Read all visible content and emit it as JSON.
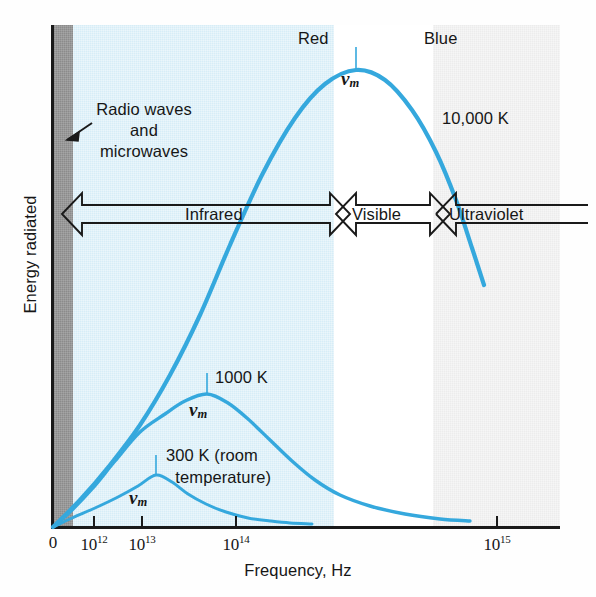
{
  "figure": {
    "axes": {
      "x_title": "Frequency, Hz",
      "y_title": "Energy radiated",
      "x_ticks": [
        {
          "label": "0",
          "sup": "",
          "x": 53
        },
        {
          "label": "10",
          "sup": "12",
          "x": 94
        },
        {
          "label": "10",
          "sup": "13",
          "x": 142
        },
        {
          "label": "10",
          "sup": "14",
          "x": 236
        },
        {
          "label": "10",
          "sup": "15",
          "x": 497
        }
      ]
    },
    "bands": [
      {
        "name": "radio-microwave-band",
        "color": "#8b8b8b"
      },
      {
        "name": "infrared-band",
        "color": "#d6edf7"
      },
      {
        "name": "visible-band",
        "color": "#ffffff"
      },
      {
        "name": "ultraviolet-band",
        "color": "#ececec"
      }
    ],
    "spectrum_arrow_labels": {
      "infrared": "Infrared",
      "visible": "Visible",
      "ultraviolet": "Ultraviolet"
    },
    "annotations": {
      "radio_waves": "Radio waves\nand\nmicrowaves",
      "red": "Red",
      "blue": "Blue",
      "curve_10000k": "10,000 K",
      "curve_1000k": "1000 K",
      "curve_300k": "300 K (room\n  temperature)",
      "nu_m_10000k": "ν",
      "nu_m_1000k": "ν",
      "nu_m_300k": "ν",
      "nu_subscript": "m"
    },
    "curve_color": "#35a8dd"
  },
  "chart_data": {
    "type": "line",
    "xlabel": "Frequency, Hz",
    "ylabel": "Energy radiated",
    "xscale": "log-like (compressed above 1e14)",
    "xticklabels": [
      "0",
      "10^12",
      "10^13",
      "10^14",
      "10^15"
    ],
    "yticklabels": [],
    "grid": false,
    "legend": "inline annotations",
    "series": [
      {
        "name": "10,000 K",
        "label": "10,000 K",
        "peak_label": "ν_m",
        "peak_frequency_hz": "~1.0e15",
        "color": "#35a8dd",
        "points_px": [
          [
            53,
            527
          ],
          [
            80,
            500
          ],
          [
            110,
            465
          ],
          [
            140,
            425
          ],
          [
            170,
            375
          ],
          [
            200,
            315
          ],
          [
            230,
            245
          ],
          [
            262,
            175
          ],
          [
            295,
            118
          ],
          [
            325,
            84
          ],
          [
            356,
            70
          ],
          [
            385,
            80
          ],
          [
            412,
            110
          ],
          [
            436,
            152
          ],
          [
            456,
            200
          ],
          [
            472,
            248
          ],
          [
            484,
            285
          ]
        ]
      },
      {
        "name": "1000 K",
        "label": "1000 K",
        "peak_label": "ν_m",
        "peak_frequency_hz": "~1.0e14",
        "color": "#35a8dd",
        "points_px": [
          [
            53,
            527
          ],
          [
            70,
            512
          ],
          [
            92,
            489
          ],
          [
            115,
            461
          ],
          [
            140,
            432
          ],
          [
            165,
            414
          ],
          [
            185,
            401
          ],
          [
            207,
            394
          ],
          [
            228,
            403
          ],
          [
            248,
            419
          ],
          [
            270,
            440
          ],
          [
            292,
            461
          ],
          [
            315,
            480
          ],
          [
            340,
            495
          ],
          [
            370,
            506
          ],
          [
            405,
            514
          ],
          [
            440,
            519
          ],
          [
            470,
            521
          ]
        ]
      },
      {
        "name": "300 K (room temperature)",
        "label": "300 K (room\ntemperature)",
        "peak_label": "ν_m",
        "peak_frequency_hz": "~2.0e13",
        "color": "#35a8dd",
        "points_px": [
          [
            53,
            527
          ],
          [
            72,
            518
          ],
          [
            95,
            508
          ],
          [
            118,
            497
          ],
          [
            138,
            486
          ],
          [
            156,
            475
          ],
          [
            172,
            482
          ],
          [
            188,
            494
          ],
          [
            206,
            504
          ],
          [
            226,
            512
          ],
          [
            248,
            518
          ],
          [
            270,
            521
          ],
          [
            290,
            523
          ],
          [
            312,
            524
          ]
        ]
      }
    ],
    "region_labels": [
      "Radio waves and microwaves",
      "Infrared",
      "Visible",
      "Ultraviolet",
      "Red",
      "Blue"
    ]
  }
}
